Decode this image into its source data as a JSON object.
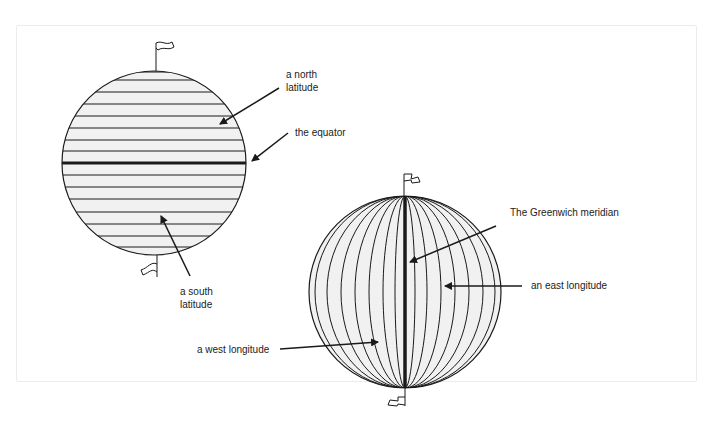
{
  "diagram": {
    "globes": [
      {
        "id": "latitude-globe",
        "labels": {
          "north_latitude": "a north\nlatitude",
          "equator": "the equator",
          "south_latitude": "a south\nlatitude"
        }
      },
      {
        "id": "longitude-globe",
        "labels": {
          "greenwich": "The Greenwich meridian",
          "east_longitude": "an east longitude",
          "west_longitude": "a west longitude"
        }
      }
    ],
    "colors": {
      "line": "#1a1a1a",
      "globe_fill": "#f1f1f1",
      "frame_border": "#ececec"
    }
  }
}
